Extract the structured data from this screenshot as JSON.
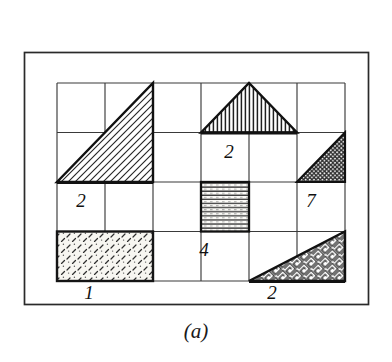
{
  "figure": {
    "caption": "(a)",
    "outer_frame": {
      "x": 24,
      "y": 52,
      "width": 344,
      "height": 252
    },
    "grid": {
      "x": 57,
      "y": 83,
      "cols": 6,
      "rows": 4,
      "cell_width": 48,
      "cell_height": 49.5,
      "line_color": "#2b2b2b"
    },
    "colors": {
      "ink": "#1a1a1a",
      "paper": "#ffffff",
      "hatch_light": "#f2f0ea",
      "hatch_dark": "#3a3a3a"
    },
    "shapes": [
      {
        "id": "triangle-left-diagonal",
        "name": "left-hatched-triangle",
        "type": "triangle",
        "fill": "diagonal-hatch",
        "cells": "cols 1-2, rows 1-2"
      },
      {
        "id": "triangle-top-center",
        "name": "top-center-vertical-hatched-triangle",
        "type": "triangle",
        "fill": "vertical-hatch",
        "cells": "cols 4-5, row 1"
      },
      {
        "id": "triangle-right-dotted",
        "name": "right-dotted-triangle",
        "type": "triangle",
        "fill": "dotted",
        "cells": "col 6, row 2"
      },
      {
        "id": "square-center-horizontal",
        "name": "center-horizontal-hatched-square",
        "type": "rectangle",
        "fill": "horizontal-hatch",
        "cells": "col 4, row 3"
      },
      {
        "id": "rect-bottom-left",
        "name": "bottom-left-speckled-rectangle",
        "type": "rectangle",
        "fill": "dash-speckle",
        "cells": "cols 1-2, row 4"
      },
      {
        "id": "triangle-bottom-right",
        "name": "bottom-right-maze-triangle",
        "type": "triangle",
        "fill": "maze-pattern",
        "cells": "cols 5-6, row 4"
      }
    ],
    "cell_labels": [
      {
        "id": "label-2-left",
        "text": "2",
        "x": 81,
        "y": 207
      },
      {
        "id": "label-2-center",
        "text": "2",
        "x": 229,
        "y": 158
      },
      {
        "id": "label-7-right",
        "text": "7",
        "x": 311,
        "y": 207
      },
      {
        "id": "label-4-center",
        "text": "4",
        "x": 204,
        "y": 256
      }
    ],
    "edge_labels": [
      {
        "id": "edge-label-1",
        "text": "1",
        "x": 89,
        "y": 297
      },
      {
        "id": "edge-label-2",
        "text": "2",
        "x": 272,
        "y": 297
      }
    ]
  }
}
